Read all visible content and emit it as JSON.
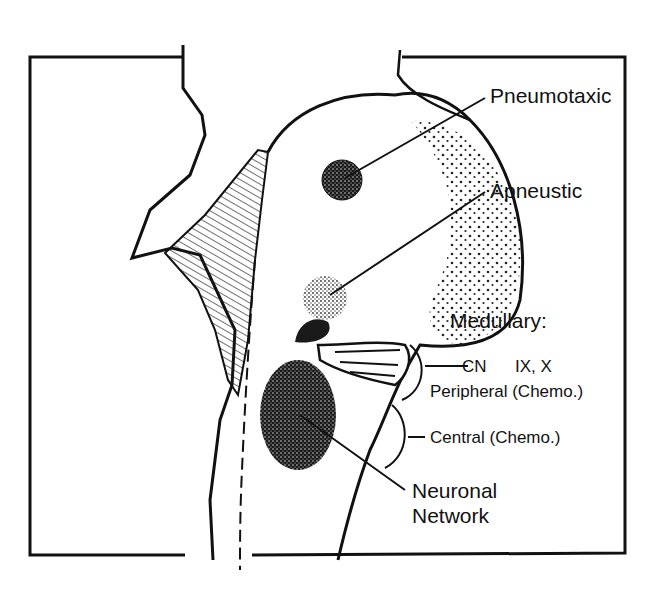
{
  "diagram": {
    "labels": {
      "pneumotaxic": "Pneumotaxic",
      "apneustic": "Apneustic",
      "medullary": "Medullary:",
      "cn": "CN",
      "cn_numbers": "IX, X",
      "peripheral": "Peripheral (Chemo.)",
      "central": "Central (Chemo.)",
      "neuronal_line1": "Neuronal",
      "neuronal_line2": "Network"
    }
  }
}
